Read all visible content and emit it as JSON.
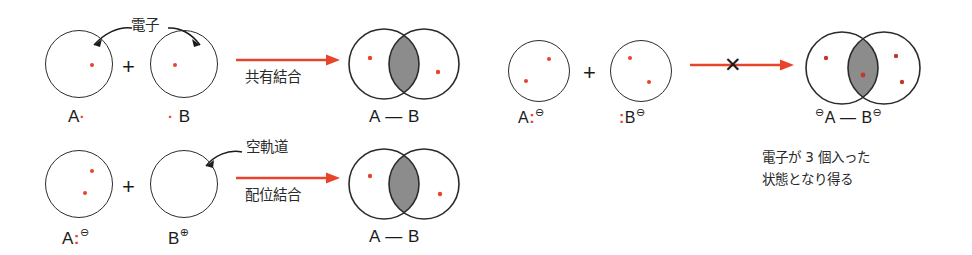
{
  "figure": {
    "colors": {
      "electron_red": "#e8442c",
      "arrow_red": "#e8442c",
      "outline": "#2b2b2b",
      "overlap_fill": "#8c8c8c",
      "text": "#1b1b1b",
      "background": "#ffffff"
    }
  },
  "left_panel": {
    "row1": {
      "annotation_label": "電子",
      "reactant_a": {
        "atom_label": "A",
        "electron_marks": "·",
        "electrons_in_orbital": 1
      },
      "plus": "+",
      "reactant_b": {
        "atom_label": "B",
        "electron_marks": "·",
        "electrons_in_orbital": 1
      },
      "arrow_label": "共有結合",
      "product": {
        "label_left": "A",
        "bond": "—",
        "label_right": "B",
        "electrons_in_overlap": 0
      }
    },
    "row2": {
      "annotation_label": "空軌道",
      "reactant_a": {
        "atom_label": "A",
        "colon": ":",
        "charge": "⊖",
        "electrons_in_orbital": 2
      },
      "plus": "+",
      "reactant_b": {
        "atom_label": "B",
        "charge": "⊕",
        "electrons_in_orbital": 0
      },
      "arrow_label": "配位結合",
      "product": {
        "label_left": "A",
        "bond": "—",
        "label_right": "B",
        "electrons_in_overlap": 0
      }
    }
  },
  "right_panel": {
    "reactant_a": {
      "atom_label": "A",
      "colon": ":",
      "charge": "⊖",
      "electrons_in_orbital": 2
    },
    "plus": "+",
    "reactant_b": {
      "colon": ":",
      "atom_label": "B",
      "charge": "⊖",
      "electrons_in_orbital": 2
    },
    "arrow_cross": "✕",
    "product": {
      "charge_left": "⊖",
      "label_left": "A",
      "bond": "—",
      "label_right": "B",
      "charge_right": "⊖",
      "electrons_total": 3
    },
    "caption_line1": "電子が 3 個入った",
    "caption_line2": "状態となり得る"
  }
}
